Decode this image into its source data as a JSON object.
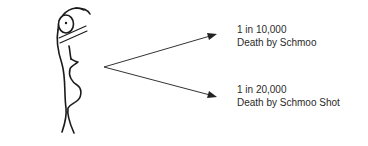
{
  "figure": {
    "outcomes": [
      {
        "odds": "1 in 10,000",
        "description": "Death by Schmoo"
      },
      {
        "odds": "1 in 20,000",
        "description": "Death by Schmoo Shot"
      }
    ]
  }
}
